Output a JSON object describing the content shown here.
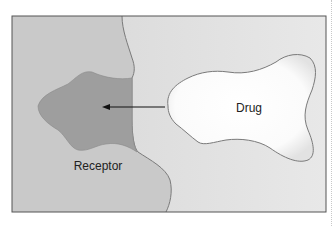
{
  "diagram": {
    "type": "drug-receptor binding schematic",
    "labels": {
      "drug": "Drug",
      "receptor": "Receptor"
    },
    "arrow": {
      "direction": "drug-to-receptor-pocket",
      "meaning": "drug binds into receptor binding site"
    },
    "colors": {
      "background": "#d9d9d9",
      "right_background": "#e6e6e6",
      "receptor_body": "#c4c4c4",
      "binding_pocket": "#9c9c9c",
      "drug_fill": "#ffffff",
      "outline": "#777777",
      "frame": "#555555",
      "arrow": "#111111"
    }
  }
}
